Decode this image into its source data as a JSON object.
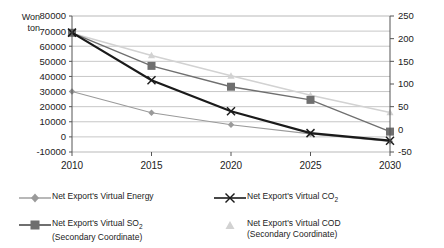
{
  "chart_data": {
    "type": "line",
    "title": "",
    "xlabel": "",
    "ylabel": "Won\nton",
    "y_unit_line1": "Won",
    "y_unit_line2": "ton",
    "categories": [
      "2010",
      "2015",
      "2020",
      "2025",
      "2030"
    ],
    "x": [
      2010,
      2015,
      2020,
      2025,
      2030
    ],
    "ylim": [
      -10000,
      80000
    ],
    "yticks": [
      80000,
      70000,
      60000,
      50000,
      40000,
      30000,
      20000,
      10000,
      0,
      -10000
    ],
    "ytick_labels": [
      "80000",
      "70000",
      "60000",
      "50000",
      "40000",
      "30000",
      "20000",
      "10000",
      "0",
      "-10000"
    ],
    "y2lim": [
      -50,
      250
    ],
    "y2ticks": [
      250,
      200,
      150,
      100,
      50,
      0,
      -50
    ],
    "y2tick_labels": [
      "250",
      "200",
      "150",
      "100",
      "50",
      "0",
      "-50"
    ],
    "grid": true,
    "legend_position": "bottom",
    "series": [
      {
        "name": "Net Export's Virtual Energy",
        "label_line1": "Net Export's Virtual Energy",
        "label_line2": "",
        "axis": "primary",
        "marker": "diamond",
        "color": "#9a9a9a",
        "values": [
          30000,
          16000,
          8000,
          2000,
          -3000
        ]
      },
      {
        "name": "Net Export's Virtual SO2",
        "label_line1": "Net Export's Virtual SO",
        "label_sub": "2",
        "label_line2": "(Secondary Coordinate)",
        "axis": "secondary",
        "marker": "square",
        "color": "#6f6f6f",
        "values": [
          213,
          140,
          94,
          65,
          -5
        ]
      },
      {
        "name": "Net Export's Virtual CO2",
        "label_line1": "Net Export's Virtual CO",
        "label_sub": "2",
        "label_line2": "",
        "axis": "primary",
        "marker": "x",
        "color": "#1a1a1a",
        "values": [
          69000,
          37500,
          17000,
          2500,
          -2500
        ]
      },
      {
        "name": "Net Export's Virtual COD",
        "label_line1": "Net Export's Virtual COD",
        "label_sub": "",
        "label_line2": "(Secondary Coordinate)",
        "axis": "secondary",
        "marker": "triangle",
        "color": "#d2d2d2",
        "values": [
          212,
          163,
          118,
          75,
          37
        ]
      }
    ]
  },
  "colors": {
    "energy": "#9a9a9a",
    "so2": "#6f6f6f",
    "co2": "#1a1a1a",
    "cod": "#d2d2d2",
    "grid": "#b9b9b9",
    "axis": "#555555"
  }
}
